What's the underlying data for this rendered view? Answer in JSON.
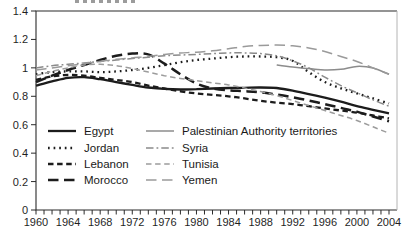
{
  "figure": {
    "background_color": "#ffffff",
    "frame": {
      "dark_color": "#2b2b2b",
      "light_right_color": "#b4b4b4"
    },
    "cropped_title_fragment_visible": true,
    "y_axis": {
      "tick_labels": [
        "1.4",
        "1.2",
        "1",
        "0.8",
        "0.6",
        "0.4",
        "0.2",
        "0"
      ],
      "tick_values": [
        1.4,
        1.2,
        1.0,
        0.8,
        0.6,
        0.4,
        0.2,
        0
      ]
    },
    "x_axis": {
      "label_years": [
        "1960",
        "1964",
        "1968",
        "1972",
        "1976",
        "1980",
        "1984",
        "1988",
        "1992",
        "1996",
        "2000",
        "2004"
      ],
      "minor_tick_every_years": 1,
      "first_year": 1960,
      "last_year": 2005
    },
    "legend": {
      "column1": [
        "Egypt",
        "Jordan",
        "Lebanon",
        "Morocco"
      ],
      "column2": [
        "Palestinian Authority territories",
        "Syria",
        "Tunisia",
        "Yemen"
      ]
    }
  },
  "chart_data": {
    "type": "line",
    "title": "",
    "xlabel": "",
    "ylabel": "",
    "xlim": [
      1960,
      2005
    ],
    "ylim": [
      0,
      1.4
    ],
    "grid": false,
    "legend_position": "lower-left inside, two columns",
    "x": [
      1960,
      1962,
      1964,
      1966,
      1968,
      1970,
      1972,
      1974,
      1976,
      1978,
      1980,
      1982,
      1984,
      1986,
      1988,
      1990,
      1992,
      1994,
      1996,
      1998,
      2000,
      2002,
      2004
    ],
    "series": [
      {
        "name": "Egypt",
        "color": "#1c1c1c",
        "line_style": "solid",
        "line_width": 2.3,
        "values": [
          0.875,
          0.905,
          0.93,
          0.935,
          0.92,
          0.9,
          0.88,
          0.862,
          0.852,
          0.848,
          0.85,
          0.855,
          0.858,
          0.86,
          0.862,
          0.858,
          0.84,
          0.815,
          0.79,
          0.762,
          0.73,
          0.705,
          0.68
        ]
      },
      {
        "name": "Jordan",
        "color": "#1c1c1c",
        "line_style": "dotted",
        "line_width": 2.3,
        "values": [
          0.955,
          0.97,
          0.975,
          0.975,
          0.97,
          0.975,
          0.985,
          1.0,
          1.02,
          1.04,
          1.055,
          1.065,
          1.075,
          1.08,
          1.08,
          1.075,
          1.05,
          0.97,
          0.9,
          0.856,
          0.82,
          0.785,
          0.75
        ]
      },
      {
        "name": "Lebanon",
        "color": "#1c1c1c",
        "line_style": "short-dash",
        "line_width": 2.3,
        "values": [
          0.915,
          0.94,
          0.95,
          0.945,
          0.93,
          0.915,
          0.9,
          0.875,
          0.855,
          0.835,
          0.82,
          0.81,
          0.8,
          0.785,
          0.768,
          0.755,
          0.745,
          0.73,
          0.715,
          0.7,
          0.685,
          0.665,
          0.645
        ]
      },
      {
        "name": "Morocco",
        "color": "#1c1c1c",
        "line_style": "long-dash",
        "line_width": 2.5,
        "values": [
          0.9,
          0.945,
          0.985,
          1.02,
          1.055,
          1.085,
          1.1,
          1.095,
          1.03,
          0.955,
          0.89,
          0.855,
          0.842,
          0.836,
          0.828,
          0.812,
          0.793,
          0.77,
          0.745,
          0.718,
          0.692,
          0.658,
          0.625
        ]
      },
      {
        "name": "Palestinian Authority territories",
        "color": "#8c8c8c",
        "line_style": "solid",
        "line_width": 1.5,
        "values": [
          null,
          null,
          null,
          null,
          null,
          null,
          null,
          null,
          null,
          null,
          null,
          null,
          null,
          null,
          null,
          1.02,
          1.005,
          0.995,
          0.985,
          0.99,
          1.01,
          1.0,
          0.955
        ]
      },
      {
        "name": "Syria",
        "color": "#8a8a8a",
        "line_style": "dash-dot",
        "line_width": 1.5,
        "values": [
          1.0,
          1.015,
          1.025,
          1.035,
          1.045,
          1.055,
          1.065,
          1.075,
          1.085,
          1.09,
          1.095,
          1.1,
          1.105,
          1.105,
          1.1,
          1.085,
          1.05,
          1.0,
          0.935,
          0.875,
          0.825,
          0.775,
          0.73
        ]
      },
      {
        "name": "Tunisia",
        "color": "#9c9c9c",
        "line_style": "short-dash",
        "line_width": 1.5,
        "values": [
          0.945,
          0.975,
          1.0,
          1.02,
          1.025,
          1.015,
          0.995,
          0.97,
          0.945,
          0.925,
          0.91,
          0.895,
          0.88,
          0.858,
          0.833,
          0.805,
          0.77,
          0.735,
          0.7,
          0.665,
          0.63,
          0.585,
          0.54
        ]
      },
      {
        "name": "Yemen",
        "color": "#9a9a9a",
        "line_style": "long-dash",
        "line_width": 1.5,
        "values": [
          0.985,
          1.0,
          1.015,
          1.03,
          1.045,
          1.06,
          1.07,
          1.08,
          1.095,
          1.105,
          1.11,
          1.12,
          1.135,
          1.15,
          1.158,
          1.16,
          1.155,
          1.14,
          1.115,
          1.08,
          1.045,
          1.0,
          0.955
        ]
      }
    ]
  }
}
